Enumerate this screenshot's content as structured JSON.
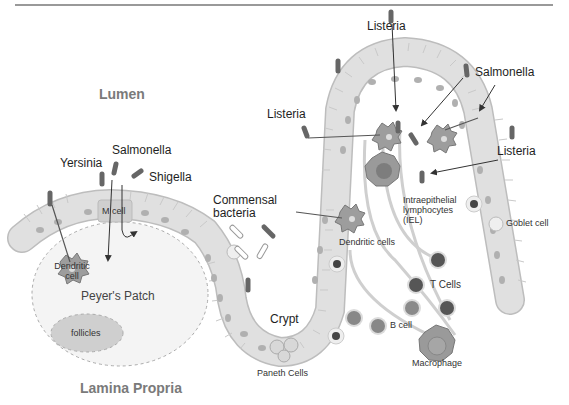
{
  "diagram": {
    "colors": {
      "epithelium": "#dcdcdc",
      "epithelium_border": "#bdbdbd",
      "nucleus": "#a9a9a9",
      "bacterium": "#6b6b6b",
      "peyers_patch": "#f2f2f2",
      "follicles": "#c8c8c8",
      "region_text": "#7a7a7a",
      "lymphocyte_dark": "#555555",
      "top_rule": "#666666"
    },
    "regions": {
      "lumen": "Lumen",
      "lamina_propria": "Lamina Propria"
    },
    "pathogens": {
      "yersinia": "Yersinia",
      "salmonella_left": "Salmonella",
      "shigella": "Shigella",
      "listeria_top": "Listeria",
      "listeria_left": "Listeria",
      "salmonella_right": "Salmonella",
      "listeria_right": "Listeria"
    },
    "structures": {
      "m_cell": "M cell",
      "dendritic_cell": "Dendritic cell",
      "peyers_patch": "Peyer's Patch",
      "follicles": "follicles",
      "commensal_bacteria": "Commensal bacteria",
      "crypt": "Crypt",
      "paneth_cells": "Paneth Cells",
      "dendritic_cells": "Dendritic cells",
      "iel": "Intraepithelial lymphocytes (IEL)",
      "goblet_cell": "Goblet cell",
      "t_cells": "T Cells",
      "b_cell": "B cell",
      "macrophage": "Macrophage"
    }
  }
}
